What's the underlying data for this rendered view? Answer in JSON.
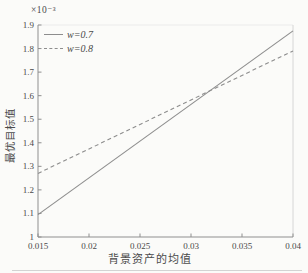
{
  "figure": {
    "y_offset_label": "×10⁻³",
    "background": "#fbfbf9"
  },
  "colors": {
    "line": "#8d8d8d",
    "axis": "#8f8f8f",
    "text": "#4a4a4a",
    "faint_border": "#d6d6d6"
  },
  "legend": {
    "position": "top-left-inside",
    "items": [
      {
        "label": "w=0.7",
        "style": "solid"
      },
      {
        "label": "w=0.8",
        "style": "dashed"
      }
    ]
  },
  "chart_data": {
    "type": "line",
    "title": "",
    "xlabel": "背景资产的均值",
    "ylabel": "最优目标值",
    "y_multiplier": 0.001,
    "y_multiplier_label": "×10⁻³",
    "xlim": [
      0.015,
      0.04
    ],
    "ylim_scaled": [
      1.0,
      1.9
    ],
    "x_ticks": [
      0.015,
      0.02,
      0.025,
      0.03,
      0.035,
      0.04
    ],
    "x_tick_labels": [
      "0.015",
      "0.02",
      "0.025",
      "0.03",
      "0.035",
      "0.04"
    ],
    "y_ticks_scaled": [
      1.0,
      1.1,
      1.2,
      1.3,
      1.4,
      1.5,
      1.6,
      1.7,
      1.8,
      1.9
    ],
    "y_tick_labels": [
      "1",
      "1.1",
      "1.2",
      "1.3",
      "1.4",
      "1.5",
      "1.6",
      "1.7",
      "1.8",
      "1.9"
    ],
    "grid": "off",
    "series": [
      {
        "name": "w=0.7",
        "style": "solid",
        "x": [
          0.015,
          0.04
        ],
        "y_scaled": [
          1.095,
          1.875
        ]
      },
      {
        "name": "w=0.8",
        "style": "dashed",
        "x": [
          0.015,
          0.04
        ],
        "y_scaled": [
          1.27,
          1.79
        ]
      }
    ]
  }
}
